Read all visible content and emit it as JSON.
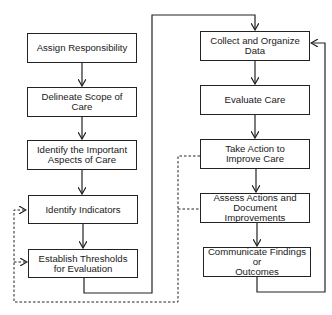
{
  "diagram": {
    "type": "flowchart",
    "left_column": [
      {
        "id": "assign",
        "label": "Assign Responsibility"
      },
      {
        "id": "delineate",
        "label": "Delineate Scope of Care"
      },
      {
        "id": "identify_aspects",
        "label": "Identify the Important\nAspects of Care"
      },
      {
        "id": "identify_indicators",
        "label": "Identify Indicators"
      },
      {
        "id": "thresholds",
        "label": "Establish Thresholds\nfor Evaluation"
      }
    ],
    "right_column": [
      {
        "id": "collect",
        "label": "Collect and Organize\nData"
      },
      {
        "id": "evaluate",
        "label": "Evaluate Care"
      },
      {
        "id": "take_action",
        "label": "Take Action to\nImprove Care"
      },
      {
        "id": "assess",
        "label": "Assess Actions and\nDocument Improvements"
      },
      {
        "id": "communicate",
        "label": "Communicate Findings or\nOutcomes"
      }
    ],
    "edges": [
      {
        "from": "assign",
        "to": "delineate",
        "style": "solid"
      },
      {
        "from": "delineate",
        "to": "identify_aspects",
        "style": "solid"
      },
      {
        "from": "identify_aspects",
        "to": "identify_indicators",
        "style": "solid"
      },
      {
        "from": "identify_indicators",
        "to": "thresholds",
        "style": "solid"
      },
      {
        "from": "thresholds",
        "to": "collect",
        "style": "solid"
      },
      {
        "from": "collect",
        "to": "evaluate",
        "style": "solid"
      },
      {
        "from": "evaluate",
        "to": "take_action",
        "style": "solid"
      },
      {
        "from": "take_action",
        "to": "assess",
        "style": "solid"
      },
      {
        "from": "assess",
        "to": "communicate",
        "style": "solid"
      },
      {
        "from": "communicate",
        "to": "collect",
        "style": "solid"
      },
      {
        "from": "take_action",
        "to": "identify_indicators",
        "style": "dashed"
      },
      {
        "from": "take_action",
        "to": "thresholds",
        "style": "dashed"
      },
      {
        "from": "assess",
        "to": "identify_indicators",
        "style": "dashed"
      },
      {
        "from": "assess",
        "to": "thresholds",
        "style": "dashed"
      }
    ]
  }
}
